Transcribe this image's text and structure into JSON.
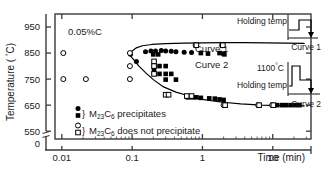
{
  "chart_data": {
    "type": "scatter",
    "title": "",
    "annotation": "0.05%C",
    "xlabel": "Time (min)",
    "ylabel_prefix": "Temperature (",
    "ylabel_unit": "°C",
    "ylabel_suffix": ")",
    "xscale": "log",
    "xlim": [
      0.008,
      35
    ],
    "ylim": [
      500,
      1000
    ],
    "xticks": [
      "0.01",
      "0.1",
      "1",
      "10"
    ],
    "xtick_values": [
      0.01,
      0.1,
      1,
      10
    ],
    "yticks": [
      "0",
      "550",
      "650",
      "750",
      "850",
      "950"
    ],
    "ytick_values": [
      0,
      550,
      650,
      750,
      850,
      950
    ],
    "y_axis_break": true,
    "grid": false,
    "frame": "box",
    "legend_position": "inside-lower-left",
    "series": [
      {
        "name": "M23C6 precipitates (circle)",
        "marker": "filled-circle",
        "points": [
          [
            0.095,
            845
          ],
          [
            0.155,
            855
          ],
          [
            0.185,
            858
          ],
          [
            0.215,
            858
          ],
          [
            0.26,
            860
          ],
          [
            0.3,
            858
          ],
          [
            0.36,
            857
          ],
          [
            0.115,
            818
          ],
          [
            0.42,
            855
          ],
          [
            0.55,
            853
          ],
          [
            0.7,
            852
          ]
        ]
      },
      {
        "name": "M23C6 precipitates (square)",
        "marker": "filled-square",
        "points": [
          [
            0.2,
            845
          ],
          [
            0.235,
            845
          ],
          [
            0.205,
            800
          ],
          [
            0.205,
            785
          ],
          [
            0.205,
            770
          ],
          [
            0.245,
            800
          ],
          [
            0.245,
            770
          ],
          [
            0.3,
            800
          ],
          [
            0.3,
            770
          ],
          [
            0.36,
            770
          ],
          [
            0.3,
            748
          ],
          [
            0.42,
            748
          ],
          [
            0.95,
            850
          ],
          [
            1.2,
            848
          ],
          [
            1.75,
            850
          ],
          [
            2.0,
            848
          ],
          [
            2.05,
            845
          ],
          [
            0.62,
            680
          ],
          [
            0.72,
            680
          ],
          [
            0.82,
            680
          ],
          [
            0.95,
            678
          ],
          [
            1.25,
            676
          ],
          [
            1.5,
            675
          ],
          [
            1.75,
            672
          ],
          [
            2.0,
            670
          ],
          [
            11.5,
            650
          ],
          [
            13.5,
            650
          ],
          [
            15.5,
            650
          ],
          [
            18,
            650
          ],
          [
            21,
            650
          ],
          [
            24,
            650
          ]
        ]
      },
      {
        "name": "M23C6 does not precipitate (circle)",
        "marker": "open-circle",
        "points": [
          [
            0.0105,
            850
          ],
          [
            0.0105,
            750
          ],
          [
            0.022,
            750
          ],
          [
            0.093,
            850
          ],
          [
            0.093,
            750
          ],
          [
            0.093,
            800
          ],
          [
            0.8,
            880
          ],
          [
            1.9,
            880
          ],
          [
            2.0,
            650
          ],
          [
            6.2,
            650
          ],
          [
            9.8,
            650
          ]
        ]
      },
      {
        "name": "M23C6 does not precipitate (square)",
        "marker": "open-square",
        "points": [
          [
            0.205,
            818
          ],
          [
            0.205,
            800
          ],
          [
            0.205,
            770
          ],
          [
            0.3,
            690
          ],
          [
            0.33,
            690
          ],
          [
            0.6,
            685
          ],
          [
            0.7,
            685
          ],
          [
            0.82,
            880
          ],
          [
            1.95,
            880
          ],
          [
            2.1,
            650
          ],
          [
            6.4,
            650
          ],
          [
            10.2,
            650
          ]
        ]
      }
    ],
    "curves": [
      {
        "name": "Curve 1",
        "label": "Curve 1",
        "points": [
          [
            0.092,
            843
          ],
          [
            0.1,
            858
          ],
          [
            0.115,
            870
          ],
          [
            0.14,
            878
          ],
          [
            0.19,
            883
          ],
          [
            0.3,
            886
          ],
          [
            0.55,
            888
          ],
          [
            1.0,
            889
          ],
          [
            2.0,
            890
          ],
          [
            4.0,
            890
          ],
          [
            8.0,
            889
          ],
          [
            16,
            888
          ],
          [
            28,
            887
          ]
        ]
      },
      {
        "name": "Curve 2",
        "label": "Curve 2",
        "points": [
          [
            0.092,
            843
          ],
          [
            0.105,
            825
          ],
          [
            0.125,
            800
          ],
          [
            0.155,
            775
          ],
          [
            0.2,
            748
          ],
          [
            0.28,
            720
          ],
          [
            0.42,
            700
          ],
          [
            0.65,
            685
          ],
          [
            1.0,
            672
          ],
          [
            1.8,
            662
          ],
          [
            3.5,
            655
          ],
          [
            7.0,
            650
          ],
          [
            14,
            648
          ],
          [
            28,
            647
          ]
        ]
      }
    ],
    "legend": [
      {
        "markers": [
          "filled-circle",
          "filled-square"
        ],
        "text_prefix": "M",
        "sub1": "23",
        "text_mid": "C",
        "sub2": "6",
        "text_suffix": " precipitates"
      },
      {
        "markers": [
          "open-circle",
          "open-square"
        ],
        "text_prefix": "M",
        "sub1": "23",
        "text_mid": "C",
        "sub2": "6",
        "text_suffix": " does not precipitate"
      }
    ]
  },
  "insets": [
    {
      "id": "curve1",
      "holding_label": "Holding temp",
      "caption": "Curve 1",
      "peak_label": ""
    },
    {
      "id": "curve2",
      "holding_label": "Holding temp",
      "caption": "Curve 2",
      "peak_label": "1100",
      "peak_unit": "°C"
    }
  ],
  "colors": {
    "axis": "#3a3a3a",
    "text": "#1a1a1a",
    "marker": "#000000",
    "curve": "#000000",
    "background": "#ffffff"
  }
}
